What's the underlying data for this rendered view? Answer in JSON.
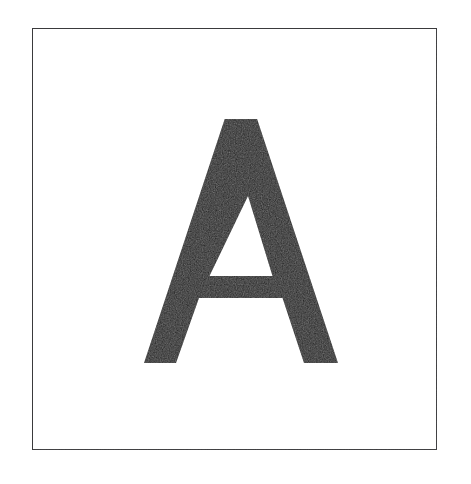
{
  "page": {
    "background_color": "#ffffff",
    "width": 471,
    "height": 484
  },
  "card": {
    "name": "letter-card",
    "border_color": "#3a3a3c",
    "border_width_px": 1.6,
    "fill_color": "#ffffff",
    "x": 32,
    "y": 28,
    "width": 405,
    "height": 422,
    "caption": "Bordered card containing a single printed letter"
  },
  "glyph": {
    "character": "A",
    "name": "letter-a-glyph",
    "style": "sans-serif uppercase",
    "color": "#1a1a1a",
    "apex_x": 207,
    "apex_y": 90,
    "baseline_y": 334,
    "crossbar_top_y": 247,
    "crossbar_bottom_y": 269,
    "left_foot_x1": 111,
    "left_foot_x2": 143,
    "right_foot_x1": 271,
    "right_foot_x2": 305,
    "counter_apex_y": 167,
    "alt_text": "Capital letter A"
  }
}
